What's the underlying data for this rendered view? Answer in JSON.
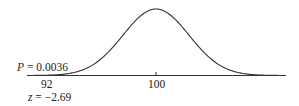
{
  "chart_data": {
    "type": "line",
    "title": "",
    "xlabel": "",
    "ylabel": "",
    "mean": 100,
    "tick_labels": [
      "92",
      "100"
    ],
    "annotations": {
      "p_value": {
        "symbol": "P",
        "text": " = 0.0036",
        "value": 0.0036
      },
      "z_score": {
        "symbol": "z",
        "text": " = −2.69",
        "value": -2.69
      },
      "observed_value": 92
    },
    "grid": false,
    "legend": null
  }
}
